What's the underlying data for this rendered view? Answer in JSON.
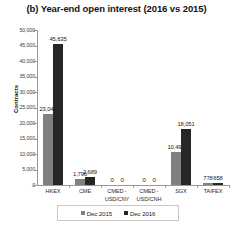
{
  "chart_data": {
    "type": "bar",
    "title": "(b) Year-end open interest (2016 vs 2015)",
    "xlabel": "",
    "ylabel": "Contracts",
    "ylim": [
      0,
      50000
    ],
    "ytick_labels": [
      "50,000",
      "45,000",
      "40,000",
      "35,000",
      "30,000",
      "25,000",
      "20,000",
      "15,000",
      "10,000",
      "5,000",
      "0"
    ],
    "ytick_values": [
      50000,
      45000,
      40000,
      35000,
      30000,
      25000,
      20000,
      15000,
      10000,
      5000,
      0
    ],
    "grid": false,
    "legend_position": "bottom",
    "categories": [
      "HKEX",
      "CME",
      "CMED - USD/CNY",
      "CMED - USD/CNH",
      "SGX",
      "TAIFEX"
    ],
    "category_lines": [
      [
        "HKEX"
      ],
      [
        "CME"
      ],
      [
        "CMED -",
        "USD/CNY"
      ],
      [
        "CMED -",
        "USD/CNH"
      ],
      [
        "SGX"
      ],
      [
        "TAIFEX"
      ]
    ],
    "series": [
      {
        "name": "Dec 2015",
        "color": "#808080",
        "values": [
          23046,
          1796,
          0,
          0,
          10495,
          778
        ],
        "labels": [
          "23,046",
          "1,796",
          "0",
          "0",
          "10,495",
          "778"
        ]
      },
      {
        "name": "Dec 2016",
        "color": "#262626",
        "values": [
          45635,
          2689,
          0,
          0,
          18051,
          658
        ],
        "labels": [
          "45,635",
          "2,689",
          "0",
          "0",
          "18,051",
          "658"
        ]
      }
    ]
  },
  "legend": {
    "items": [
      {
        "label": "Dec 2015",
        "color": "#808080"
      },
      {
        "label": "Dec 2016",
        "color": "#262626"
      }
    ]
  }
}
